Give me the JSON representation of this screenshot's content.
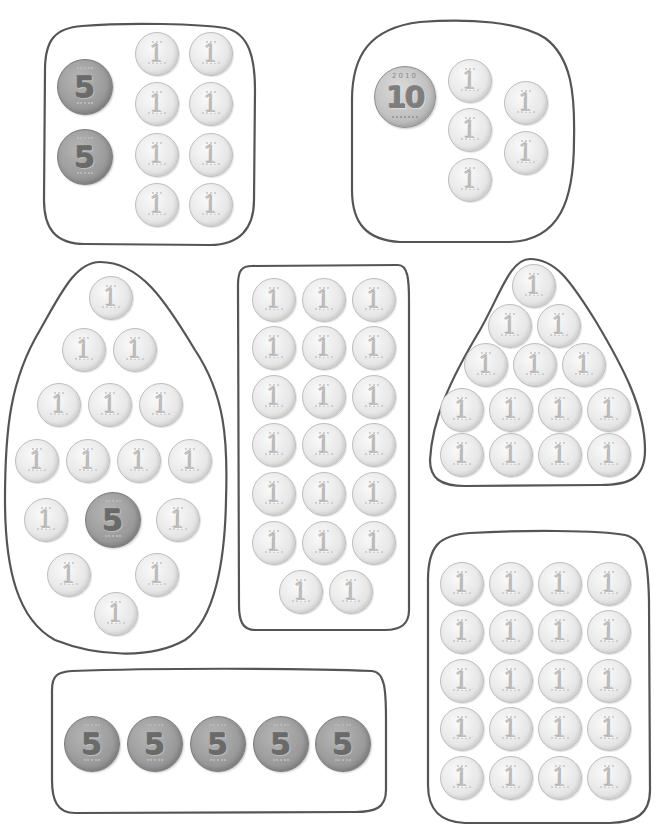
{
  "worksheet": {
    "description": "Coin counting groups (Korean won coins: 1, 5, 10)",
    "coin_types": {
      "one": {
        "label": "1",
        "color": "#e4e4e4"
      },
      "five": {
        "label": "5",
        "color": "#9a9a9a"
      },
      "ten": {
        "label": "10",
        "year": "2010",
        "color": "#c4c4c4"
      }
    },
    "groups": [
      {
        "id": "group-a",
        "coins": [
          5,
          5,
          1,
          1,
          1,
          1,
          1,
          1,
          1,
          1
        ],
        "total": 18
      },
      {
        "id": "group-b",
        "coins": [
          10,
          1,
          1,
          1,
          1,
          1
        ],
        "total": 15
      },
      {
        "id": "group-c",
        "coins": [
          1,
          1,
          1,
          1,
          1,
          1,
          1,
          1,
          1,
          1,
          1,
          5,
          1,
          1,
          1,
          1
        ],
        "total": 20
      },
      {
        "id": "group-d",
        "coins": [
          1,
          1,
          1,
          1,
          1,
          1,
          1,
          1,
          1,
          1,
          1,
          1,
          1,
          1,
          1,
          1,
          1,
          1,
          1,
          1
        ],
        "total": 20
      },
      {
        "id": "group-e",
        "coins": [
          1,
          1,
          1,
          1,
          1,
          1,
          1,
          1,
          1,
          1,
          1,
          1,
          1,
          1
        ],
        "total": 14
      },
      {
        "id": "group-f",
        "coins": [
          5,
          5,
          5,
          5,
          5
        ],
        "total": 25
      },
      {
        "id": "group-g",
        "coins": [
          1,
          1,
          1,
          1,
          1,
          1,
          1,
          1,
          1,
          1,
          1,
          1,
          1,
          1,
          1,
          1,
          1,
          1,
          1,
          1
        ],
        "total": 20
      }
    ],
    "labels": {
      "one": "1",
      "five": "5",
      "ten": "10",
      "ten_year": "2010"
    }
  }
}
